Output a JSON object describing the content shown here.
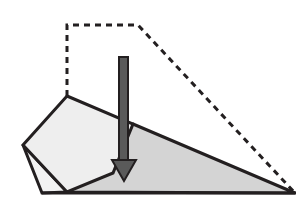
{
  "figure": {
    "name": "block-on-incline-diagram",
    "title": "",
    "background_color": "#ffffff",
    "width": 307,
    "height": 203
  },
  "colors": {
    "stroke": "#231f20",
    "block_fill": "#eeeeee",
    "ramp_fill": "#d4d4d4",
    "sliver_fill": "#f2f2f2",
    "arrow_fill": "#5a5a5a",
    "arrow_stroke": "#231f20",
    "dashed_stroke": "#231f20"
  },
  "shapes": {
    "dashed_outline": {
      "name": "dashed-construction-outline",
      "points": "67,96 67,25 138,25 295,193",
      "stroke_width": 3,
      "dash_pattern": "6 5"
    },
    "ramp": {
      "name": "incline-ramp-triangle",
      "points": "133,124 295,193 67,192",
      "stroke_width": 3
    },
    "block": {
      "name": "tilted-square-block",
      "points": "67,96 133,124 113,173 67,192 23,145",
      "stroke_width": 3
    },
    "sliver": {
      "name": "left-sliver-triangle",
      "points": "23,145 42,193 67,192",
      "stroke_width": 3
    },
    "ground": {
      "name": "ground-line",
      "x1": 42,
      "y1": 193,
      "x2": 296,
      "y2": 193,
      "stroke_width": 3
    },
    "arrow": {
      "name": "downward-force-arrow",
      "shaft_points": "119,57 128,57 128,163 119,163",
      "head_points": "112,160 136,160 124,181",
      "stroke_width": 2,
      "direction": "down"
    }
  }
}
